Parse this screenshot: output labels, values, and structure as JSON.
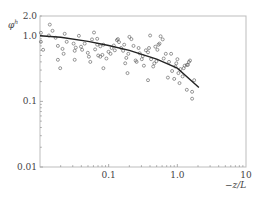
{
  "chart_data": {
    "type": "scatter",
    "title": "",
    "xlabel": "−z/L",
    "ylabel": "φh",
    "xscale": "log",
    "yscale": "log",
    "xlim": [
      0.01,
      10
    ],
    "ylim": [
      0.01,
      2.0
    ],
    "grid": false,
    "legend": null,
    "x_ticks": [
      {
        "value": 0.1,
        "label": "0.1"
      },
      {
        "value": 1.0,
        "label": "1.0"
      },
      {
        "value": 10,
        "label": "10"
      }
    ],
    "y_ticks": [
      {
        "value": 0.01,
        "label": "0.01"
      },
      {
        "value": 0.1,
        "label": "0.1"
      },
      {
        "value": 1.0,
        "label": "1.0"
      },
      {
        "value": 2.0,
        "label": "2.0"
      }
    ],
    "series": [
      {
        "name": "observations",
        "marker": "open-circle",
        "points": [
          [
            0.0103,
            1.11
          ],
          [
            0.0103,
            0.81
          ],
          [
            0.0111,
            0.61
          ],
          [
            0.0135,
            1.01
          ],
          [
            0.0139,
            1.48
          ],
          [
            0.0152,
            1.19
          ],
          [
            0.0169,
            0.93
          ],
          [
            0.0182,
            0.7
          ],
          [
            0.0182,
            0.43
          ],
          [
            0.0213,
            0.63
          ],
          [
            0.0221,
            0.53
          ],
          [
            0.0229,
            1.07
          ],
          [
            0.0245,
            0.81
          ],
          [
            0.0309,
            0.76
          ],
          [
            0.032,
            0.59
          ],
          [
            0.0332,
            0.66
          ],
          [
            0.0368,
            1.0
          ],
          [
            0.0395,
            0.68
          ],
          [
            0.041,
            0.61
          ],
          [
            0.0448,
            0.76
          ],
          [
            0.0497,
            0.55
          ],
          [
            0.0516,
            0.48
          ],
          [
            0.0571,
            0.88
          ],
          [
            0.0612,
            1.12
          ],
          [
            0.0635,
            0.62
          ],
          [
            0.068,
            0.9
          ],
          [
            0.068,
            0.73
          ],
          [
            0.0705,
            0.5
          ],
          [
            0.0755,
            0.48
          ],
          [
            0.0755,
            0.69
          ],
          [
            0.0811,
            0.51
          ],
          [
            0.0838,
            0.73
          ],
          [
            0.0927,
            0.45
          ],
          [
            0.0993,
            0.57
          ],
          [
            0.1064,
            0.53
          ],
          [
            0.1102,
            0.65
          ],
          [
            0.1187,
            0.71
          ],
          [
            0.123,
            0.6
          ],
          [
            0.1318,
            0.86
          ],
          [
            0.1365,
            0.89
          ],
          [
            0.1414,
            0.8
          ],
          [
            0.1515,
            0.65
          ],
          [
            0.1624,
            0.59
          ],
          [
            0.1682,
            0.73
          ],
          [
            0.1742,
            0.38
          ],
          [
            0.1805,
            0.46
          ],
          [
            0.1934,
            0.53
          ],
          [
            0.2003,
            0.96
          ],
          [
            0.2146,
            0.89
          ],
          [
            0.2299,
            0.7
          ],
          [
            0.2464,
            0.42
          ],
          [
            0.2552,
            0.4
          ],
          [
            0.2733,
            0.65
          ],
          [
            0.2832,
            0.54
          ],
          [
            0.3034,
            0.44
          ],
          [
            0.3143,
            0.49
          ],
          [
            0.3256,
            0.35
          ],
          [
            0.349,
            0.6
          ],
          [
            0.3739,
            0.56
          ],
          [
            0.3873,
            0.65
          ],
          [
            0.4012,
            1.01
          ],
          [
            0.4156,
            0.44
          ],
          [
            0.4452,
            0.34
          ],
          [
            0.4612,
            0.38
          ],
          [
            0.4777,
            0.68
          ],
          [
            0.4949,
            0.41
          ],
          [
            0.5126,
            0.61
          ],
          [
            0.531,
            0.73
          ],
          [
            0.5501,
            0.76
          ],
          [
            0.5699,
            0.98
          ],
          [
            0.6115,
            0.88
          ],
          [
            0.6334,
            0.45
          ],
          [
            0.6796,
            0.53
          ],
          [
            0.7292,
            0.23
          ],
          [
            0.7554,
            0.4
          ],
          [
            0.8105,
            0.53
          ],
          [
            0.8396,
            0.29
          ],
          [
            0.9008,
            0.22
          ],
          [
            0.9332,
            0.34
          ],
          [
            0.9667,
            0.38
          ],
          [
            1.0015,
            0.44
          ],
          [
            1.0374,
            0.27
          ],
          [
            1.0747,
            0.19
          ],
          [
            1.1133,
            0.31
          ],
          [
            1.1945,
            0.24
          ],
          [
            1.2374,
            0.32
          ],
          [
            1.2818,
            0.35
          ],
          [
            1.3753,
            0.36
          ],
          [
            1.3753,
            0.15
          ],
          [
            1.4247,
            0.36
          ],
          [
            1.4759,
            0.4
          ],
          [
            1.529,
            0.42
          ],
          [
            1.6405,
            0.11
          ],
          [
            1.7602,
            0.21
          ],
          [
            1.6405,
            0.14
          ],
          [
            0.3739,
            0.21
          ],
          [
            0.188,
            0.27
          ],
          [
            0.0541,
            0.4
          ],
          [
            0.0838,
            0.32
          ],
          [
            0.0197,
            0.32
          ],
          [
            0.032,
            0.43
          ]
        ]
      },
      {
        "name": "fit",
        "marker": "line",
        "points": [
          [
            0.01,
            1.0
          ],
          [
            0.02,
            0.95
          ],
          [
            0.05,
            0.82
          ],
          [
            0.1,
            0.71
          ],
          [
            0.2,
            0.6
          ],
          [
            0.5,
            0.44
          ],
          [
            1.0,
            0.32
          ],
          [
            1.5,
            0.22
          ],
          [
            2.06,
            0.163
          ]
        ]
      }
    ],
    "caption": ""
  }
}
